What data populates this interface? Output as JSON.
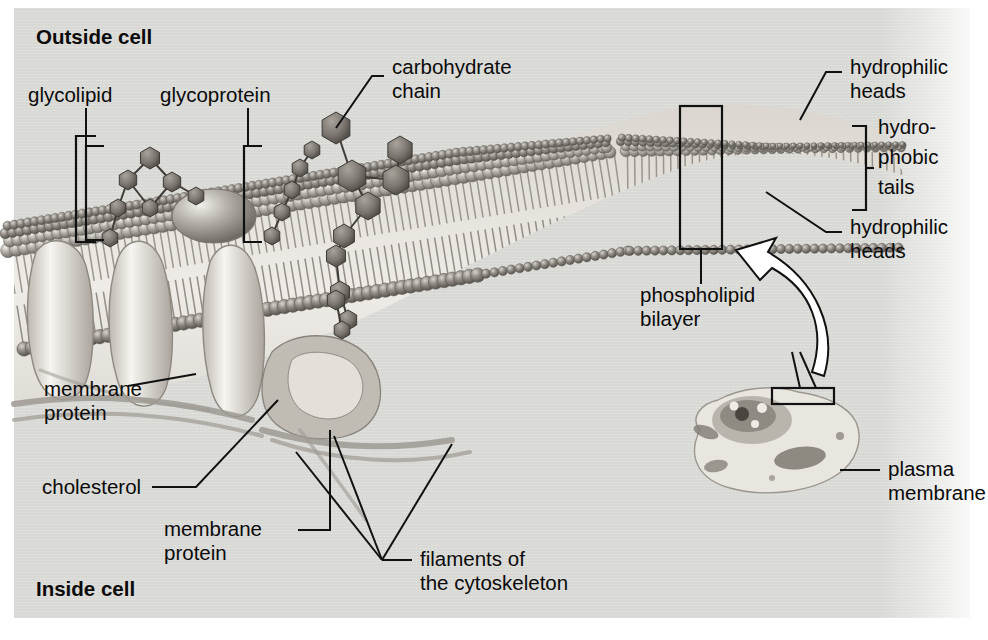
{
  "figure": {
    "panel_color": "#d9d9d6",
    "ink_color": "#0b0b0b"
  },
  "orientation": {
    "outside": "Outside cell",
    "inside": "Inside cell"
  },
  "labels": {
    "glycolipid": "glycolipid",
    "glycoprotein": "glycoprotein",
    "carbohydrate_chain_l1": "carbohydrate",
    "carbohydrate_chain_l2": "chain",
    "hydrophilic_heads_top_l1": "hydrophilic",
    "hydrophilic_heads_top_l2": "heads",
    "hydrophobic_tails_l1": "hydro-",
    "hydrophobic_tails_l2": "phobic",
    "hydrophobic_tails_l3": "tails",
    "hydrophilic_heads_bottom_l1": "hydrophilic",
    "hydrophilic_heads_bottom_l2": "heads",
    "phospholipid_bilayer_l1": "phospholipid",
    "phospholipid_bilayer_l2": "bilayer",
    "membrane_protein_left_l1": "membrane",
    "membrane_protein_left_l2": "protein",
    "cholesterol": "cholesterol",
    "membrane_protein_lower_l1": "membrane",
    "membrane_protein_lower_l2": "protein",
    "filaments_l1": "filaments of",
    "filaments_l2": "the cytoskeleton",
    "plasma_membrane_l1": "plasma",
    "plasma_membrane_l2": "membrane"
  },
  "icons": {
    "callout_arrow": "curved-arrow-icon",
    "inset_cell": "cell-inset-icon",
    "bilayer_box": "magnify-region-box-icon"
  }
}
